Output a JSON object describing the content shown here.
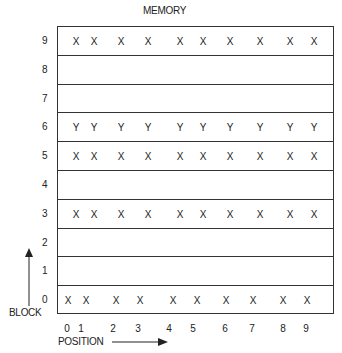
{
  "title": "MEMORY",
  "axis": {
    "y_label": "BLOCK",
    "x_label": "POSITION"
  },
  "blocks": [
    {
      "label": "9",
      "cells": [
        "X",
        "X",
        "X",
        "X",
        "X",
        "X",
        "X",
        "X",
        "X",
        "X"
      ]
    },
    {
      "label": "8",
      "cells": []
    },
    {
      "label": "7",
      "cells": []
    },
    {
      "label": "6",
      "cells": [
        "Y",
        "Y",
        "Y",
        "Y",
        "Y",
        "Y",
        "Y",
        "Y",
        "Y",
        "Y"
      ]
    },
    {
      "label": "5",
      "cells": [
        "X",
        "X",
        "X",
        "X",
        "X",
        "X",
        "X",
        "X",
        "X",
        "X"
      ]
    },
    {
      "label": "4",
      "cells": []
    },
    {
      "label": "3",
      "cells": [
        "X",
        "X",
        "X",
        "X",
        "X",
        "X",
        "X",
        "X",
        "X",
        "X"
      ]
    },
    {
      "label": "2",
      "cells": []
    },
    {
      "label": "1",
      "cells": []
    },
    {
      "label": "0",
      "cells": [
        "X",
        "X",
        "X",
        "X",
        "X",
        "X",
        "X",
        "X",
        "X",
        "X"
      ]
    }
  ],
  "positions": [
    "0",
    "1",
    "2",
    "3",
    "4",
    "5",
    "6",
    "7",
    "8",
    "9"
  ]
}
